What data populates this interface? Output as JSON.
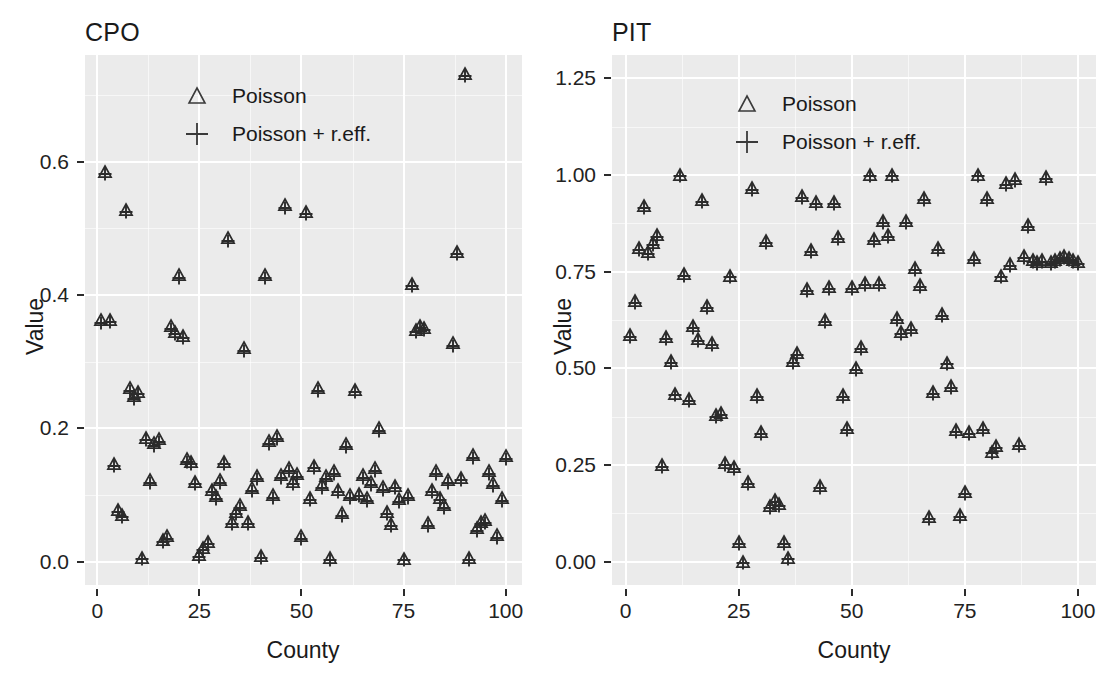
{
  "figure": {
    "width": 1101,
    "height": 673,
    "panel_background": "#ebebeb",
    "gridline_color": "#ffffff",
    "marker_color": "#2b2b2b"
  },
  "legend": {
    "items": [
      {
        "key": "triangle",
        "label": "Poisson"
      },
      {
        "key": "plus",
        "label": "Poisson + r.eff."
      }
    ]
  },
  "axes": {
    "xlabel": "County",
    "ylabel": "Value"
  },
  "chart_data": [
    {
      "type": "scatter",
      "title": "CPO",
      "xlabel": "County",
      "ylabel": "Value",
      "xlim": [
        -3,
        104
      ],
      "ylim": [
        -0.035,
        0.76
      ],
      "xticks": [
        0,
        25,
        50,
        75,
        100
      ],
      "xtick_labels": [
        "0",
        "25",
        "50",
        "75",
        "100"
      ],
      "yticks": [
        0.0,
        0.2,
        0.4,
        0.6
      ],
      "ytick_labels": [
        "0.0",
        "0.2",
        "0.4",
        "0.6"
      ],
      "grid": true,
      "legend_position": "top-left-inside",
      "series": [
        {
          "name": "Poisson",
          "marker": "triangle",
          "x": [
            1,
            2,
            3,
            4,
            5,
            6,
            7,
            8,
            9,
            10,
            11,
            12,
            13,
            14,
            15,
            16,
            17,
            18,
            19,
            20,
            21,
            22,
            23,
            24,
            25,
            26,
            27,
            28,
            29,
            30,
            31,
            32,
            33,
            34,
            35,
            36,
            37,
            38,
            39,
            40,
            41,
            42,
            43,
            44,
            45,
            46,
            47,
            48,
            49,
            50,
            51,
            52,
            53,
            54,
            55,
            56,
            57,
            58,
            59,
            60,
            61,
            62,
            63,
            64,
            65,
            66,
            67,
            68,
            69,
            70,
            71,
            72,
            73,
            74,
            75,
            76,
            77,
            78,
            79,
            80,
            81,
            82,
            83,
            84,
            85,
            86,
            87,
            88,
            89,
            90,
            91,
            92,
            93,
            94,
            95,
            96,
            97,
            98,
            99,
            100
          ],
          "y": [
            0.362,
            0.585,
            0.363,
            0.147,
            0.078,
            0.07,
            0.528,
            0.26,
            0.248,
            0.255,
            0.006,
            0.186,
            0.122,
            0.178,
            0.184,
            0.033,
            0.038,
            0.353,
            0.345,
            0.43,
            0.339,
            0.154,
            0.15,
            0.12,
            0.01,
            0.02,
            0.03,
            0.108,
            0.098,
            0.122,
            0.15,
            0.485,
            0.06,
            0.075,
            0.085,
            0.32,
            0.06,
            0.11,
            0.128,
            0.008,
            0.43,
            0.181,
            0.1,
            0.188,
            0.13,
            0.535,
            0.14,
            0.12,
            0.131,
            0.038,
            0.525,
            0.096,
            0.144,
            0.26,
            0.115,
            0.128,
            0.005,
            0.136,
            0.108,
            0.073,
            0.176,
            0.1,
            0.258,
            0.102,
            0.13,
            0.095,
            0.119,
            0.14,
            0.2,
            0.112,
            0.075,
            0.057,
            0.114,
            0.094,
            0.004,
            0.1,
            0.417,
            0.348,
            0.354,
            0.351,
            0.058,
            0.108,
            0.136,
            0.096,
            0.085,
            0.122,
            0.328,
            0.465,
            0.126,
            0.732,
            0.006,
            0.16,
            0.05,
            0.06,
            0.062,
            0.136,
            0.118,
            0.04,
            0.095,
            0.158
          ]
        },
        {
          "name": "Poisson + r.eff.",
          "marker": "plus",
          "x": [
            1,
            2,
            3,
            4,
            5,
            6,
            7,
            8,
            9,
            10,
            11,
            12,
            13,
            14,
            15,
            16,
            17,
            18,
            19,
            20,
            21,
            22,
            23,
            24,
            25,
            26,
            27,
            28,
            29,
            30,
            31,
            32,
            33,
            34,
            35,
            36,
            37,
            38,
            39,
            40,
            41,
            42,
            43,
            44,
            45,
            46,
            47,
            48,
            49,
            50,
            51,
            52,
            53,
            54,
            55,
            56,
            57,
            58,
            59,
            60,
            61,
            62,
            63,
            64,
            65,
            66,
            67,
            68,
            69,
            70,
            71,
            72,
            73,
            74,
            75,
            76,
            77,
            78,
            79,
            80,
            81,
            82,
            83,
            84,
            85,
            86,
            87,
            88,
            89,
            90,
            91,
            92,
            93,
            94,
            95,
            96,
            97,
            98,
            99,
            100
          ],
          "y": [
            0.358,
            0.582,
            0.36,
            0.144,
            0.074,
            0.067,
            0.524,
            0.256,
            0.244,
            0.251,
            0.004,
            0.182,
            0.118,
            0.174,
            0.18,
            0.03,
            0.034,
            0.349,
            0.341,
            0.426,
            0.335,
            0.15,
            0.146,
            0.116,
            0.007,
            0.017,
            0.027,
            0.104,
            0.094,
            0.118,
            0.146,
            0.481,
            0.056,
            0.071,
            0.081,
            0.316,
            0.056,
            0.106,
            0.124,
            0.005,
            0.426,
            0.177,
            0.096,
            0.184,
            0.126,
            0.531,
            0.136,
            0.116,
            0.127,
            0.034,
            0.521,
            0.092,
            0.14,
            0.256,
            0.111,
            0.124,
            0.003,
            0.132,
            0.104,
            0.069,
            0.172,
            0.096,
            0.254,
            0.098,
            0.126,
            0.091,
            0.115,
            0.136,
            0.196,
            0.108,
            0.071,
            0.053,
            0.11,
            0.09,
            0.002,
            0.096,
            0.413,
            0.344,
            0.35,
            0.347,
            0.054,
            0.104,
            0.132,
            0.092,
            0.081,
            0.118,
            0.324,
            0.461,
            0.122,
            0.728,
            0.003,
            0.156,
            0.046,
            0.056,
            0.058,
            0.132,
            0.114,
            0.036,
            0.091,
            0.154
          ]
        }
      ]
    },
    {
      "type": "scatter",
      "title": "PIT",
      "xlabel": "County",
      "ylabel": "Value",
      "xlim": [
        -3,
        104
      ],
      "ylim": [
        -0.06,
        1.31
      ],
      "xticks": [
        0,
        25,
        50,
        75,
        100
      ],
      "xtick_labels": [
        "0",
        "25",
        "50",
        "75",
        "100"
      ],
      "yticks": [
        0.0,
        0.25,
        0.5,
        0.75,
        1.0,
        1.25
      ],
      "ytick_labels": [
        "0.00",
        "0.25",
        "0.50",
        "0.75",
        "1.00",
        "1.25"
      ],
      "grid": true,
      "legend_position": "top-left-inside",
      "series": [
        {
          "name": "Poisson",
          "marker": "triangle",
          "x": [
            1,
            2,
            3,
            4,
            5,
            6,
            7,
            8,
            9,
            10,
            11,
            12,
            13,
            14,
            15,
            16,
            17,
            18,
            19,
            20,
            21,
            22,
            23,
            24,
            25,
            26,
            27,
            28,
            29,
            30,
            31,
            32,
            33,
            34,
            35,
            36,
            37,
            38,
            39,
            40,
            41,
            42,
            43,
            44,
            45,
            46,
            47,
            48,
            49,
            50,
            51,
            52,
            53,
            54,
            55,
            56,
            57,
            58,
            59,
            60,
            61,
            62,
            63,
            64,
            65,
            66,
            67,
            68,
            69,
            70,
            71,
            72,
            73,
            74,
            75,
            76,
            77,
            78,
            79,
            80,
            81,
            82,
            83,
            84,
            85,
            86,
            87,
            88,
            89,
            90,
            91,
            92,
            93,
            94,
            95,
            96,
            97,
            98,
            99,
            100
          ],
          "y": [
            0.585,
            0.675,
            0.81,
            0.92,
            0.8,
            0.825,
            0.845,
            0.25,
            0.58,
            0.52,
            0.435,
            1.0,
            0.745,
            0.42,
            0.61,
            0.575,
            0.935,
            0.66,
            0.565,
            0.38,
            0.385,
            0.255,
            0.74,
            0.245,
            0.05,
            0.0,
            0.205,
            0.965,
            0.43,
            0.335,
            0.83,
            0.145,
            0.16,
            0.15,
            0.05,
            0.01,
            0.52,
            0.54,
            0.945,
            0.705,
            0.805,
            0.93,
            0.195,
            0.625,
            0.71,
            0.93,
            0.84,
            0.43,
            0.345,
            0.71,
            0.5,
            0.555,
            0.72,
            1.0,
            0.835,
            0.72,
            0.88,
            0.845,
            1.0,
            0.63,
            0.595,
            0.88,
            0.605,
            0.76,
            0.715,
            0.94,
            0.115,
            0.44,
            0.81,
            0.64,
            0.515,
            0.455,
            0.34,
            0.12,
            0.18,
            0.335,
            0.785,
            1.0,
            0.345,
            0.94,
            0.285,
            0.3,
            0.74,
            0.98,
            0.77,
            0.99,
            0.305,
            0.79,
            0.87,
            0.78,
            0.775,
            0.78,
            0.995,
            0.775,
            0.78,
            0.785,
            0.79,
            0.785,
            0.78,
            0.775
          ]
        },
        {
          "name": "Poisson + r.eff.",
          "marker": "plus",
          "x": [
            1,
            2,
            3,
            4,
            5,
            6,
            7,
            8,
            9,
            10,
            11,
            12,
            13,
            14,
            15,
            16,
            17,
            18,
            19,
            20,
            21,
            22,
            23,
            24,
            25,
            26,
            27,
            28,
            29,
            30,
            31,
            32,
            33,
            34,
            35,
            36,
            37,
            38,
            39,
            40,
            41,
            42,
            43,
            44,
            45,
            46,
            47,
            48,
            49,
            50,
            51,
            52,
            53,
            54,
            55,
            56,
            57,
            58,
            59,
            60,
            61,
            62,
            63,
            64,
            65,
            66,
            67,
            68,
            69,
            70,
            71,
            72,
            73,
            74,
            75,
            76,
            77,
            78,
            79,
            80,
            81,
            82,
            83,
            84,
            85,
            86,
            87,
            88,
            89,
            90,
            91,
            92,
            93,
            94,
            95,
            96,
            97,
            98,
            99,
            100
          ],
          "y": [
            0.58,
            0.67,
            0.805,
            0.915,
            0.795,
            0.82,
            0.84,
            0.246,
            0.575,
            0.515,
            0.43,
            0.996,
            0.74,
            0.415,
            0.605,
            0.57,
            0.93,
            0.655,
            0.56,
            0.375,
            0.38,
            0.25,
            0.735,
            0.24,
            0.045,
            -0.004,
            0.2,
            0.96,
            0.425,
            0.33,
            0.825,
            0.14,
            0.155,
            0.145,
            0.045,
            0.006,
            0.515,
            0.535,
            0.94,
            0.7,
            0.8,
            0.925,
            0.19,
            0.62,
            0.705,
            0.925,
            0.835,
            0.425,
            0.34,
            0.705,
            0.495,
            0.55,
            0.715,
            0.996,
            0.83,
            0.715,
            0.875,
            0.84,
            0.996,
            0.625,
            0.59,
            0.875,
            0.6,
            0.755,
            0.71,
            0.935,
            0.11,
            0.435,
            0.805,
            0.635,
            0.51,
            0.45,
            0.335,
            0.115,
            0.175,
            0.33,
            0.78,
            0.996,
            0.34,
            0.935,
            0.28,
            0.295,
            0.735,
            0.975,
            0.765,
            0.985,
            0.3,
            0.785,
            0.865,
            0.775,
            0.77,
            0.775,
            0.99,
            0.77,
            0.775,
            0.78,
            0.785,
            0.78,
            0.775,
            0.77
          ]
        }
      ]
    }
  ]
}
